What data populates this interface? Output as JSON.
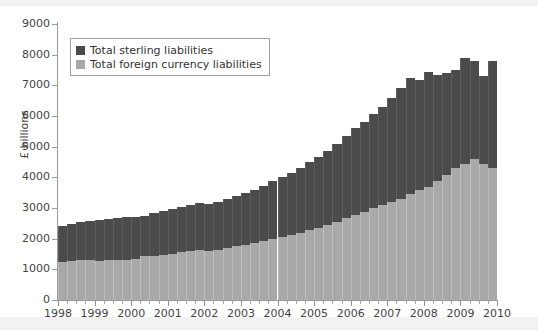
{
  "chart_data": {
    "type": "bar",
    "stacked": true,
    "title": "",
    "subtitle": "",
    "xlabel": "",
    "ylabel": "£ billions",
    "xlim": [
      1998,
      2010
    ],
    "ylim": [
      0,
      9000
    ],
    "ytick_labels": [
      "0",
      "1000",
      "2000",
      "3000",
      "4000",
      "5000",
      "6000",
      "7000",
      "8000",
      "9000"
    ],
    "ytick_values": [
      0,
      1000,
      2000,
      3000,
      4000,
      5000,
      6000,
      7000,
      8000,
      9000
    ],
    "xtick_labels": [
      "1998",
      "1999",
      "2000",
      "2001",
      "2002",
      "2003",
      "2004",
      "2005",
      "2006",
      "2007",
      "2008",
      "2009",
      "2010"
    ],
    "xtick_values": [
      1998,
      1999,
      2000,
      2001,
      2002,
      2003,
      2004,
      2005,
      2006,
      2007,
      2008,
      2009,
      2010
    ],
    "minor_ticks_per_year": 4,
    "grid": false,
    "legend_position": "upper-left-inside",
    "legend": [
      "Total sterling liabilities",
      "Total foreign currency liabilities"
    ],
    "colors": {
      "sterling": "#4b4b4b",
      "foreign": "#a9a9a9",
      "axis": "#9a9a9a",
      "background": "#ffffff",
      "figure_background": "#f2f2f2",
      "text": "#444444"
    },
    "x": [
      1998.0,
      1998.25,
      1998.5,
      1998.75,
      1999.0,
      1999.25,
      1999.5,
      1999.75,
      2000.0,
      2000.25,
      2000.5,
      2000.75,
      2001.0,
      2001.25,
      2001.5,
      2001.75,
      2002.0,
      2002.25,
      2002.5,
      2002.75,
      2003.0,
      2003.25,
      2003.5,
      2003.75,
      2004.0,
      2004.25,
      2004.5,
      2004.75,
      2005.0,
      2005.25,
      2005.5,
      2005.75,
      2006.0,
      2006.25,
      2006.5,
      2006.75,
      2007.0,
      2007.25,
      2007.5,
      2007.75,
      2008.0,
      2008.25,
      2008.5,
      2008.75,
      2009.0,
      2009.25,
      2009.5,
      2009.75
    ],
    "series": [
      {
        "name": "Total foreign currency liabilities",
        "color": "#a9a9a9",
        "values": [
          1250,
          1270,
          1290,
          1300,
          1280,
          1300,
          1310,
          1320,
          1350,
          1420,
          1450,
          1480,
          1500,
          1560,
          1600,
          1620,
          1600,
          1640,
          1700,
          1760,
          1800,
          1870,
          1930,
          2000,
          2060,
          2130,
          2200,
          2280,
          2360,
          2450,
          2560,
          2680,
          2760,
          2880,
          3000,
          3100,
          3200,
          3300,
          3450,
          3600,
          3700,
          3880,
          4080,
          4300,
          4450,
          4600,
          4420,
          4300
        ]
      },
      {
        "name": "Total sterling liabilities",
        "color": "#4b4b4b",
        "values": [
          1150,
          1200,
          1250,
          1280,
          1330,
          1350,
          1380,
          1400,
          1350,
          1330,
          1380,
          1420,
          1460,
          1480,
          1500,
          1540,
          1520,
          1560,
          1600,
          1640,
          1680,
          1720,
          1800,
          1880,
          1940,
          2020,
          2120,
          2220,
          2300,
          2420,
          2540,
          2680,
          2840,
          2920,
          3060,
          3200,
          3380,
          3600,
          3800,
          3560,
          3720,
          3450,
          3320,
          3200,
          3450,
          3200,
          2900,
          3500
        ]
      }
    ]
  }
}
